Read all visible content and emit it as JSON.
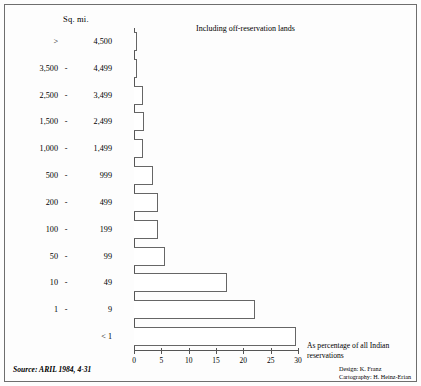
{
  "figure": {
    "header_label": "Sq. mi.",
    "inclusion_note": "Including off-reservation lands",
    "axis_note": "As percentage of all Indian reservations",
    "source": "Source: ARIL 1984, 4-31",
    "source_label": "Source:",
    "source_ref": "ARIL 1984, 4-31",
    "design_credit": "Design: K. Franz",
    "cartography_credit": "Cartography: H. Heinz-Erian",
    "frame_color": "#6e6e6e",
    "bar_outline_color": "#666666",
    "bar_fill_color": "#ffffff"
  },
  "chart_data": {
    "type": "bar",
    "orientation": "horizontal",
    "title": "",
    "subtitle": "Including off-reservation lands",
    "xlabel": "As percentage of all Indian reservations",
    "ylabel": "Sq. mi.",
    "xlim": [
      0,
      30
    ],
    "xticks": [
      0,
      5,
      10,
      15,
      20,
      25,
      30
    ],
    "xtick_labels": [
      "0",
      "5",
      "10",
      "15",
      "20",
      "25",
      "30"
    ],
    "grid": false,
    "legend": "none",
    "categories": [
      "> 4,500",
      "3,500 - 4,499",
      "2,500 - 3,499",
      "1,500 - 2,499",
      "1,000 - 1,499",
      "500 - 999",
      "200 - 499",
      "100 - 199",
      "50 - 99",
      "10 - 49",
      "1 - 9",
      "< 1"
    ],
    "category_parts": [
      {
        "lo": ">",
        "dash": "",
        "hi": "4,500"
      },
      {
        "lo": "3,500",
        "dash": "-",
        "hi": "4,499"
      },
      {
        "lo": "2,500",
        "dash": "-",
        "hi": "3,499"
      },
      {
        "lo": "1,500",
        "dash": "-",
        "hi": "2,499"
      },
      {
        "lo": "1,000",
        "dash": "-",
        "hi": "1,499"
      },
      {
        "lo": "500",
        "dash": "-",
        "hi": "999"
      },
      {
        "lo": "200",
        "dash": "-",
        "hi": "499"
      },
      {
        "lo": "100",
        "dash": "-",
        "hi": "199"
      },
      {
        "lo": "50",
        "dash": "-",
        "hi": "99"
      },
      {
        "lo": "10",
        "dash": "-",
        "hi": "49"
      },
      {
        "lo": "1",
        "dash": "-",
        "hi": "9"
      },
      {
        "lo": "",
        "dash": "",
        "hi": "< 1"
      }
    ],
    "values": [
      0.5,
      0.5,
      1.6,
      1.8,
      1.6,
      3.4,
      4.3,
      4.3,
      5.7,
      17.0,
      22.2,
      29.6
    ],
    "value_unit": "percent"
  }
}
